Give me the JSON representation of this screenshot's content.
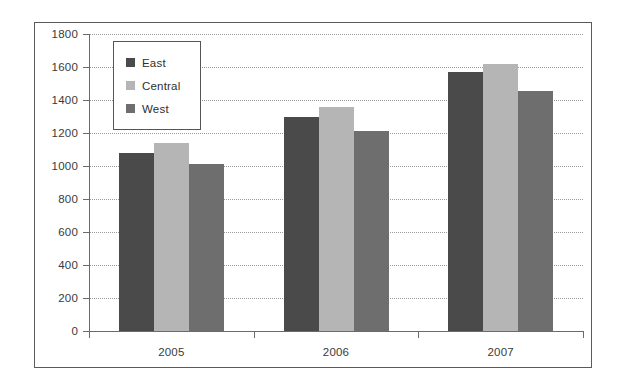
{
  "chart_data": {
    "type": "bar",
    "title": "",
    "subtitle": "",
    "xlabel": "",
    "ylabel": "",
    "categories": [
      "2005",
      "2006",
      "2007"
    ],
    "series": [
      {
        "name": "East",
        "color": "#4a4a4a",
        "values": [
          1080,
          1300,
          1570
        ]
      },
      {
        "name": "Central",
        "color": "#b5b5b5",
        "values": [
          1140,
          1355,
          1620
        ]
      },
      {
        "name": "West",
        "color": "#6e6e6e",
        "values": [
          1010,
          1215,
          1455
        ]
      }
    ],
    "ylim": [
      0,
      1800
    ],
    "ytick_step": 200,
    "yticks": [
      1800,
      1600,
      1400,
      1200,
      1000,
      800,
      600,
      400,
      200,
      0
    ],
    "ytick_labels": [
      "1800",
      "1600",
      "1400",
      "1200",
      "1000",
      "800",
      "600",
      "400",
      "200",
      "0"
    ],
    "grid": true,
    "grid_axis": "y",
    "grid_style": "dotted",
    "legend_position": "top-left",
    "legend_entries": [
      "East",
      "Central",
      "West"
    ],
    "border": true
  },
  "colors": {
    "east": "#4a4a4a",
    "central": "#b5b5b5",
    "west": "#6e6e6e",
    "axis": "#6b6b6b",
    "grid": "#9a9a9a",
    "frame": "#5a5a5a",
    "text": "#3a3a3a",
    "background": "#ffffff"
  }
}
